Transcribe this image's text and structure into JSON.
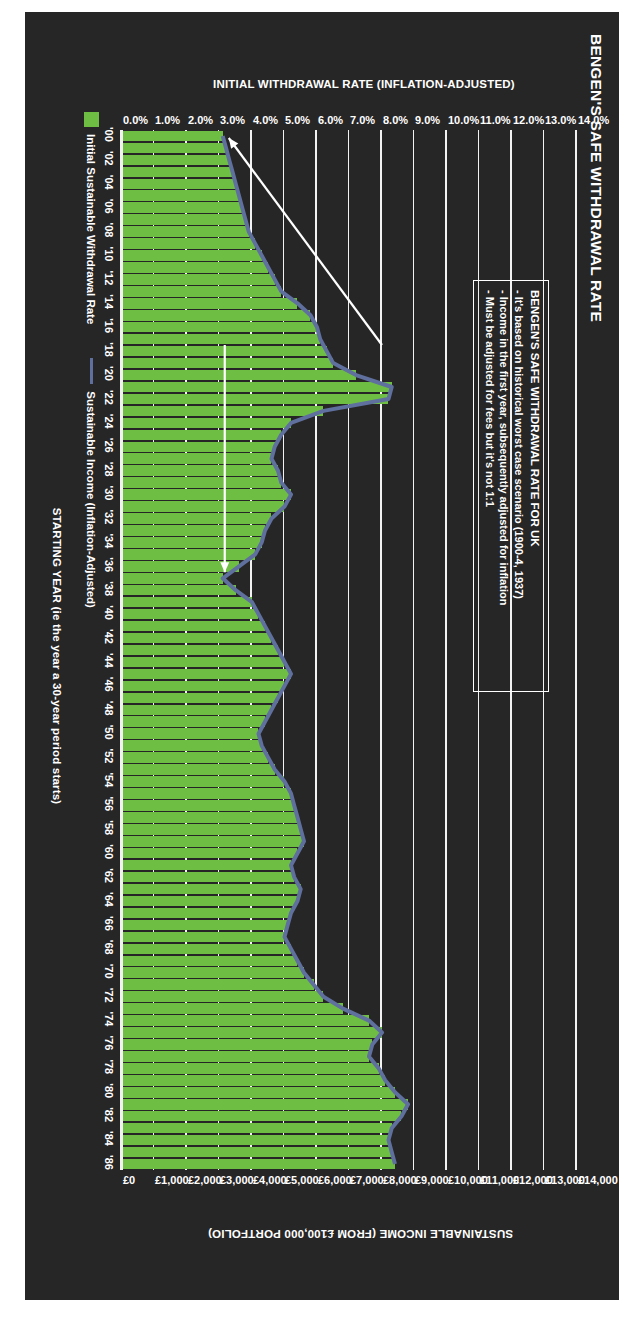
{
  "figure": {
    "title": "BENGEN'S SAFE WITHDRAWAL RATE",
    "background_color": "#272626",
    "bar_color": "#6fbe44",
    "line_color": "#5f6f9e",
    "grid_color": "#f2f2f2",
    "text_color": "#ffffff"
  },
  "callout": {
    "heading": "BENGEN'S SAFE WITHDRAWAL RATE FOR UK",
    "bullets": [
      "- It's based on historical worst case scenario (1900-4, 1937)",
      "- Income in the first year, subsequently adjusted for inflation",
      "- Must be adjusted for fees but it's not 1:1"
    ]
  },
  "legend": {
    "items": [
      {
        "label": "Initial Sustainable Withdrawal Rate",
        "marker": "green-swatch",
        "color": "#6fbe44"
      },
      {
        "label": "Sustainable Income (Inflation-Adjusted)",
        "marker": "blue-line",
        "color": "#5f6f9e"
      }
    ]
  },
  "chart_data": {
    "type": "bar",
    "title": "BENGEN'S SAFE WITHDRAWAL RATE",
    "xlabel": "STARTING YEAR (ie the year a 30-year period starts)",
    "ylabel": "INITIAL WITHDRAWAL RATE (INFLATION-ADJUSTED)",
    "y2label": "SUSTAINABLE INCOME (FROM £100,000 PORTFOLIO)",
    "grid": true,
    "legend_position": "bottom-left",
    "ylim": [
      0,
      14
    ],
    "y2lim": [
      0,
      14000
    ],
    "ytick_labels": [
      "0.0%",
      "1.0%",
      "2.0%",
      "3.0%",
      "4.0%",
      "5.0%",
      "6.0%",
      "7.0%",
      "8.0%",
      "9.0%",
      "10.0%",
      "11.0%",
      "12.0%",
      "13.0%",
      "14.0%"
    ],
    "ytick_values": [
      0,
      1,
      2,
      3,
      4,
      5,
      6,
      7,
      8,
      9,
      10,
      11,
      12,
      13,
      14
    ],
    "y2tick_labels": [
      "£0",
      "£1,000",
      "£2,000",
      "£3,000",
      "£4,000",
      "£5,000",
      "£6,000",
      "£7,000",
      "£8,000",
      "£9,000",
      "£10,000",
      "£11,000",
      "£12,000",
      "£13,000",
      "£14,000"
    ],
    "y2tick_values": [
      0,
      1000,
      2000,
      3000,
      4000,
      5000,
      6000,
      7000,
      8000,
      9000,
      10000,
      11000,
      12000,
      13000,
      14000
    ],
    "xtick_labels": [
      "'00",
      "'02",
      "'04",
      "'06",
      "'08",
      "'10",
      "'12",
      "'14",
      "'16",
      "'18",
      "'20",
      "'22",
      "'24",
      "'26",
      "'28",
      "'30",
      "'32",
      "'34",
      "'36",
      "'38",
      "'40",
      "'42",
      "'44",
      "'46",
      "'48",
      "'50",
      "'52",
      "'54",
      "'56",
      "'58",
      "'60",
      "'62",
      "'64",
      "'66",
      "'68",
      "'70",
      "'72",
      "'74",
      "'76",
      "'78",
      "'80",
      "'82",
      "'84",
      "'86"
    ],
    "categories": [
      "'00",
      "'01",
      "'02",
      "'03",
      "'04",
      "'05",
      "'06",
      "'07",
      "'08",
      "'09",
      "'10",
      "'11",
      "'12",
      "'13",
      "'14",
      "'15",
      "'16",
      "'17",
      "'18",
      "'19",
      "'20",
      "'21",
      "'22",
      "'23",
      "'24",
      "'25",
      "'26",
      "'27",
      "'28",
      "'29",
      "'30",
      "'31",
      "'32",
      "'33",
      "'34",
      "'35",
      "'36",
      "'37",
      "'38",
      "'39",
      "'40",
      "'41",
      "'42",
      "'43",
      "'44",
      "'45",
      "'46",
      "'47",
      "'48",
      "'49",
      "'50",
      "'51",
      "'52",
      "'53",
      "'54",
      "'55",
      "'56",
      "'57",
      "'58",
      "'59",
      "'60",
      "'61",
      "'62",
      "'63",
      "'64",
      "'65",
      "'66",
      "'67",
      "'68",
      "'69",
      "'70",
      "'71",
      "'72",
      "'73",
      "'74",
      "'75",
      "'76",
      "'77",
      "'78",
      "'79",
      "'80",
      "'81",
      "'82",
      "'83",
      "'84",
      "'85",
      "'86"
    ],
    "series": [
      {
        "name": "Initial Sustainable Withdrawal Rate",
        "type": "bar",
        "unit": "percent",
        "values": [
          3.1,
          3.2,
          3.3,
          3.4,
          3.5,
          3.6,
          3.7,
          3.8,
          3.9,
          4.1,
          4.3,
          4.5,
          4.7,
          4.9,
          5.4,
          5.8,
          6.0,
          6.1,
          6.3,
          6.5,
          7.2,
          8.3,
          8.2,
          6.2,
          5.2,
          4.9,
          4.7,
          4.6,
          4.8,
          4.9,
          5.2,
          5.0,
          4.6,
          4.4,
          4.3,
          4.1,
          3.6,
          3.1,
          3.5,
          4.0,
          4.2,
          4.4,
          4.6,
          4.8,
          5.0,
          5.2,
          5.0,
          4.8,
          4.6,
          4.4,
          4.2,
          4.3,
          4.5,
          4.7,
          5.0,
          5.2,
          5.3,
          5.4,
          5.5,
          5.6,
          5.4,
          5.2,
          5.3,
          5.5,
          5.4,
          5.2,
          5.1,
          5.0,
          5.2,
          5.4,
          5.6,
          5.9,
          6.2,
          6.8,
          7.6,
          8.0,
          7.7,
          7.6,
          7.9,
          8.1,
          8.4,
          8.8,
          8.6,
          8.3,
          8.2,
          8.3,
          8.4
        ],
        "color": "#6fbe44"
      },
      {
        "name": "Sustainable Income (Inflation-Adjusted)",
        "type": "line",
        "unit": "gbp",
        "values": [
          3100,
          3200,
          3300,
          3400,
          3500,
          3600,
          3700,
          3800,
          3900,
          4100,
          4300,
          4500,
          4700,
          4900,
          5400,
          5800,
          6000,
          6100,
          6300,
          6500,
          7200,
          8300,
          8200,
          6200,
          5200,
          4900,
          4700,
          4600,
          4800,
          4900,
          5200,
          5000,
          4600,
          4400,
          4300,
          4100,
          3600,
          3100,
          3500,
          4000,
          4200,
          4400,
          4600,
          4800,
          5000,
          5200,
          5000,
          4800,
          4600,
          4400,
          4200,
          4300,
          4500,
          4700,
          5000,
          5200,
          5300,
          5400,
          5500,
          5600,
          5400,
          5200,
          5300,
          5500,
          5400,
          5200,
          5100,
          5000,
          5200,
          5400,
          5600,
          5900,
          6200,
          6800,
          7600,
          8000,
          7700,
          7600,
          7900,
          8100,
          8400,
          8800,
          8600,
          8300,
          8200,
          8300,
          8400
        ],
        "color": "#5f6f9e"
      }
    ],
    "annotations": [
      {
        "name": "arrow-to-1937-low",
        "text": "",
        "target_category": "'37"
      },
      {
        "name": "arrow-to-2000-start",
        "text": "",
        "target_category": "'00"
      }
    ]
  }
}
